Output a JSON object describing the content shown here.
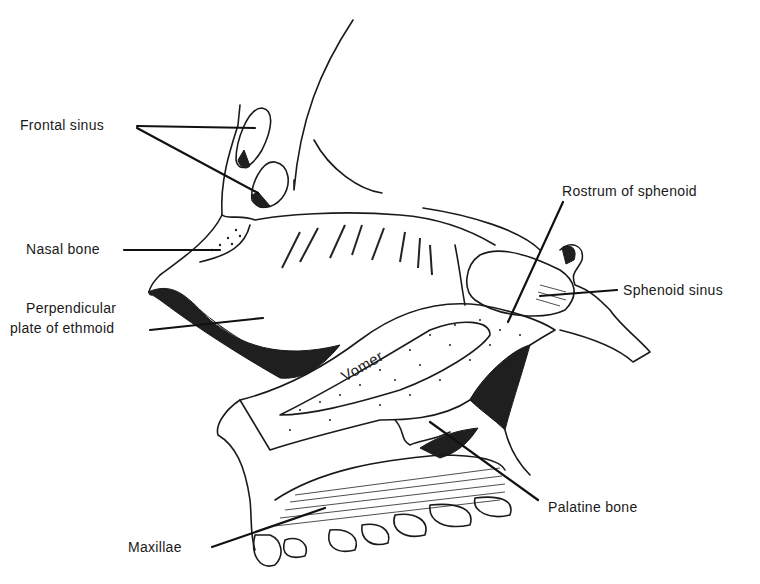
{
  "figure": {
    "colors": {
      "ink": "#1a1a1a",
      "background": "#ffffff"
    }
  },
  "labels": {
    "frontal_sinus": "Frontal sinus",
    "nasal_bone": "Nasal bone",
    "perpendicular_plate_line1": "Perpendicular",
    "perpendicular_plate_line2": "plate of ethmoid",
    "rostrum_of_sphenoid": "Rostrum of sphenoid",
    "sphenoid_sinus": "Sphenoid sinus",
    "vomer": "Vomer",
    "palatine_bone": "Palatine bone",
    "maxillae": "Maxillae"
  }
}
